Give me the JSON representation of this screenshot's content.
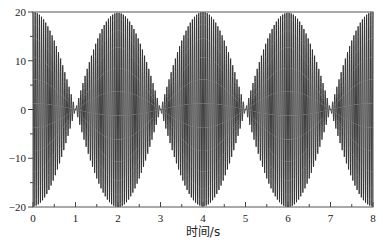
{
  "chart_data": {
    "type": "line",
    "title": "",
    "xlabel": "时间/s",
    "ylabel": "",
    "xlim": [
      0,
      8
    ],
    "ylim": [
      -20,
      20
    ],
    "xticks": [
      "0",
      "1",
      "2",
      "3",
      "4",
      "5",
      "6",
      "7",
      "8"
    ],
    "yticks": [
      "20",
      "10",
      "0",
      "-10",
      "-20"
    ],
    "grid": false,
    "legend": null,
    "series": [
      {
        "name": "beat signal",
        "description": "High-frequency oscillation with amplitude envelope 20|cos(pi t/2)|; envelope maxima 20 at t=0,2,4,6,8 and nodes at t=1,3,5,7",
        "envelope_amplitude": 20,
        "envelope_period_s": 2,
        "carrier_cycles_per_s": 20,
        "x": [
          0,
          1,
          2,
          3,
          4,
          5,
          6,
          7,
          8
        ],
        "envelope": [
          20,
          0,
          20,
          0,
          20,
          0,
          20,
          0,
          20
        ]
      }
    ],
    "color": "#2a2a2a"
  }
}
